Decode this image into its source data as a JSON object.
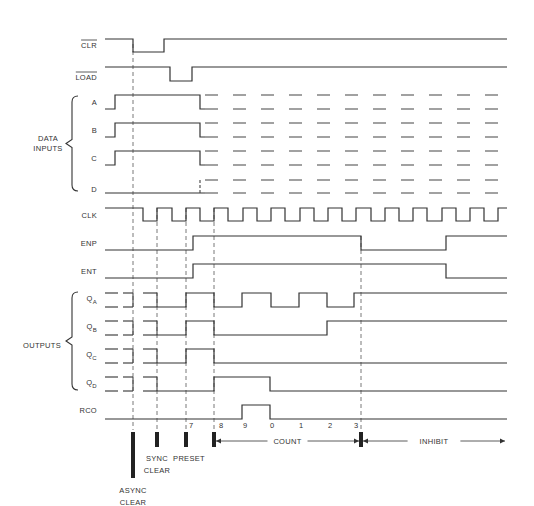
{
  "diagram": {
    "type": "timing-diagram",
    "colors": {
      "line": "#333333",
      "background": "#ffffff"
    },
    "signals": [
      {
        "id": "clr",
        "label": "CLR",
        "overbar": true,
        "y_high": 39,
        "y_low": 52,
        "label_y": 48,
        "points": [
          [
            105,
            39
          ],
          [
            133,
            39
          ],
          [
            133,
            52
          ],
          [
            164,
            52
          ],
          [
            164,
            39
          ],
          [
            507,
            39
          ]
        ]
      },
      {
        "id": "load",
        "label": "LOAD",
        "overbar": true,
        "y_high": 67,
        "y_low": 81,
        "label_y": 80,
        "points": [
          [
            105,
            67
          ],
          [
            170,
            67
          ],
          [
            170,
            81
          ],
          [
            192,
            81
          ],
          [
            192,
            67
          ],
          [
            507,
            67
          ]
        ]
      },
      {
        "id": "a",
        "label": "A",
        "group": "data",
        "label_y": 105,
        "points": [
          [
            105,
            109
          ],
          [
            115,
            109
          ],
          [
            115,
            95
          ],
          [
            200,
            95
          ],
          [
            200,
            109
          ],
          [
            205,
            109
          ]
        ],
        "dashed_high": 95,
        "dashed_low": 109
      },
      {
        "id": "b",
        "label": "B",
        "group": "data",
        "label_y": 133,
        "points": [
          [
            105,
            137
          ],
          [
            115,
            137
          ],
          [
            115,
            123
          ],
          [
            200,
            123
          ],
          [
            200,
            137
          ],
          [
            205,
            137
          ]
        ],
        "dashed_high": 123,
        "dashed_low": 137
      },
      {
        "id": "c",
        "label": "C",
        "group": "data",
        "label_y": 161,
        "points": [
          [
            105,
            165
          ],
          [
            115,
            165
          ],
          [
            115,
            151
          ],
          [
            200,
            151
          ],
          [
            200,
            165
          ],
          [
            205,
            165
          ]
        ],
        "dashed_high": 151,
        "dashed_low": 165
      },
      {
        "id": "d",
        "label": "D",
        "group": "data",
        "label_y": 192,
        "points": [
          [
            105,
            193
          ],
          [
            205,
            193
          ]
        ],
        "dashed_high": 180,
        "dashed_low": 193
      },
      {
        "id": "clk",
        "label": "CLK",
        "label_y": 218,
        "points": [
          [
            105,
            208
          ],
          [
            143,
            208
          ],
          [
            143,
            221
          ],
          [
            157,
            221
          ],
          [
            157,
            208
          ],
          [
            172,
            208
          ],
          [
            172,
            221
          ],
          [
            186,
            221
          ],
          [
            186,
            208
          ],
          [
            200,
            208
          ],
          [
            200,
            221
          ],
          [
            214,
            221
          ],
          [
            214,
            208
          ],
          [
            228,
            208
          ],
          [
            228,
            221
          ],
          [
            243,
            221
          ],
          [
            243,
            208
          ],
          [
            257,
            208
          ],
          [
            257,
            221
          ],
          [
            271,
            221
          ],
          [
            271,
            208
          ],
          [
            285,
            208
          ],
          [
            285,
            221
          ],
          [
            300,
            221
          ],
          [
            300,
            208
          ],
          [
            314,
            208
          ],
          [
            314,
            221
          ],
          [
            328,
            221
          ],
          [
            328,
            208
          ],
          [
            342,
            208
          ],
          [
            342,
            221
          ],
          [
            356,
            221
          ],
          [
            356,
            208
          ],
          [
            371,
            208
          ],
          [
            371,
            221
          ],
          [
            385,
            221
          ],
          [
            385,
            208
          ],
          [
            399,
            208
          ],
          [
            399,
            221
          ],
          [
            413,
            221
          ],
          [
            413,
            208
          ],
          [
            427,
            208
          ],
          [
            427,
            221
          ],
          [
            442,
            221
          ],
          [
            442,
            208
          ],
          [
            456,
            208
          ],
          [
            456,
            221
          ],
          [
            470,
            221
          ],
          [
            470,
            208
          ],
          [
            484,
            208
          ],
          [
            484,
            221
          ],
          [
            498,
            221
          ],
          [
            498,
            208
          ],
          [
            507,
            208
          ]
        ]
      },
      {
        "id": "enp",
        "label": "ENP",
        "label_y": 246,
        "points": [
          [
            105,
            250
          ],
          [
            193,
            250
          ],
          [
            193,
            236
          ],
          [
            361,
            236
          ],
          [
            361,
            250
          ],
          [
            446,
            250
          ],
          [
            446,
            236
          ],
          [
            507,
            236
          ]
        ]
      },
      {
        "id": "ent",
        "label": "ENT",
        "label_y": 274,
        "points": [
          [
            105,
            278
          ],
          [
            193,
            278
          ],
          [
            193,
            264
          ],
          [
            446,
            264
          ],
          [
            446,
            278
          ],
          [
            507,
            278
          ]
        ]
      },
      {
        "id": "qa",
        "label": "Q",
        "sub": "A",
        "group": "outputs",
        "label_y": 301,
        "points": [
          [
            157,
            307
          ],
          [
            186,
            307
          ],
          [
            186,
            293
          ],
          [
            214,
            293
          ],
          [
            214,
            307
          ],
          [
            242,
            307
          ],
          [
            242,
            293
          ],
          [
            271,
            293
          ],
          [
            271,
            307
          ],
          [
            299,
            307
          ],
          [
            299,
            293
          ],
          [
            327,
            293
          ],
          [
            327,
            307
          ],
          [
            354,
            307
          ],
          [
            354,
            293
          ],
          [
            507,
            293
          ]
        ],
        "pre_high": 293,
        "pre_low": 307
      },
      {
        "id": "qb",
        "label": "Q",
        "sub": "B",
        "group": "outputs",
        "label_y": 329,
        "points": [
          [
            157,
            335
          ],
          [
            186,
            335
          ],
          [
            186,
            321
          ],
          [
            214,
            321
          ],
          [
            214,
            335
          ],
          [
            327,
            335
          ],
          [
            327,
            321
          ],
          [
            507,
            321
          ]
        ],
        "pre_high": 321,
        "pre_low": 335
      },
      {
        "id": "qc",
        "label": "Q",
        "sub": "C",
        "group": "outputs",
        "label_y": 357,
        "points": [
          [
            157,
            363
          ],
          [
            186,
            363
          ],
          [
            186,
            349
          ],
          [
            214,
            349
          ],
          [
            214,
            363
          ],
          [
            507,
            363
          ]
        ],
        "pre_high": 349,
        "pre_low": 363
      },
      {
        "id": "qd",
        "label": "Q",
        "sub": "D",
        "group": "outputs",
        "label_y": 385,
        "points": [
          [
            157,
            391
          ],
          [
            214,
            391
          ],
          [
            214,
            377
          ],
          [
            270,
            377
          ],
          [
            270,
            391
          ],
          [
            507,
            391
          ]
        ],
        "pre_high": 377,
        "pre_low": 391
      },
      {
        "id": "rco",
        "label": "RCO",
        "label_y": 413,
        "points": [
          [
            105,
            419
          ],
          [
            242,
            419
          ],
          [
            242,
            405
          ],
          [
            270,
            405
          ],
          [
            270,
            419
          ],
          [
            507,
            419
          ]
        ]
      }
    ],
    "groups": [
      {
        "id": "data",
        "label_lines": [
          "DATA",
          "INPUTS"
        ],
        "brace_top": 96,
        "brace_bottom": 191,
        "label_x": 48,
        "label_y": 143
      },
      {
        "id": "outputs",
        "label_lines": [
          "OUTPUTS"
        ],
        "brace_top": 292,
        "brace_bottom": 390,
        "label_x": 42,
        "label_y": 345
      }
    ],
    "vertical_guides": [
      133,
      157,
      186,
      214,
      361
    ],
    "count_digits": [
      {
        "text": "7",
        "x": 189
      },
      {
        "text": "8",
        "x": 219
      },
      {
        "text": "9",
        "x": 243
      },
      {
        "text": "0",
        "x": 270
      },
      {
        "text": "1",
        "x": 299
      },
      {
        "text": "2",
        "x": 328
      },
      {
        "text": "3",
        "x": 354
      }
    ],
    "markers": [
      {
        "id": "async-clear",
        "x": 133,
        "y1": 432,
        "y2": 478,
        "label_lines": [
          "ASYNC",
          "CLEAR"
        ],
        "label_x": 133,
        "label_y": 487
      },
      {
        "id": "sync-clear",
        "x": 157,
        "y1": 432,
        "y2": 447,
        "label_lines": [
          "SYNC",
          "CLEAR"
        ],
        "label_x": 157,
        "label_y": 455
      },
      {
        "id": "preset",
        "x": 186,
        "y1": 432,
        "y2": 447,
        "label_lines": [
          "PRESET"
        ],
        "label_x": 189,
        "label_y": 455
      },
      {
        "id": "count-start",
        "x": 214,
        "y1": 432,
        "y2": 447,
        "label_lines": [],
        "label_x": 0,
        "label_y": 0
      },
      {
        "id": "count-end",
        "x": 361,
        "y1": 432,
        "y2": 447,
        "label_lines": [],
        "label_x": 0,
        "label_y": 0
      }
    ],
    "spans": [
      {
        "id": "count",
        "label": "COUNT",
        "x1": 216,
        "x2": 359,
        "y": 441
      },
      {
        "id": "inhibit",
        "label": "INHIBIT",
        "x1": 363,
        "x2": 505,
        "y": 441
      }
    ],
    "pre_dash_segments": [
      [
        105,
        118
      ],
      [
        123,
        133
      ],
      [
        143,
        157
      ]
    ]
  }
}
